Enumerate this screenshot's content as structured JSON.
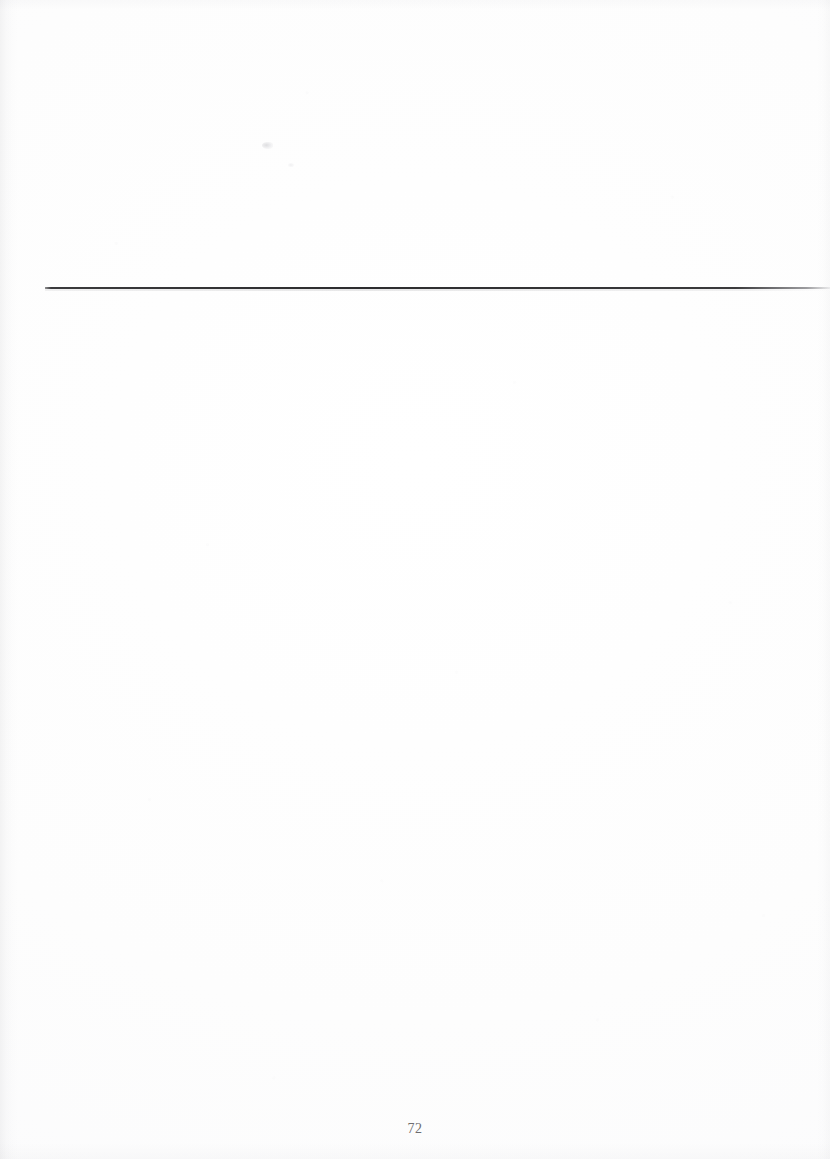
{
  "document": {
    "kind": "scanned-book-page",
    "page_number": "72",
    "body_text": "",
    "header_text": ""
  },
  "page": {
    "folio": "72",
    "rule": {
      "name": "header-rule",
      "color": "#2c2c2e"
    },
    "artifacts": {
      "speck_label": "",
      "noise_label": ""
    },
    "colors": {
      "paper": "#ffffff",
      "rule": "#2c2c2e",
      "folio_text": "#6d6d70",
      "scan_shadow": "#9a9a9f"
    }
  }
}
